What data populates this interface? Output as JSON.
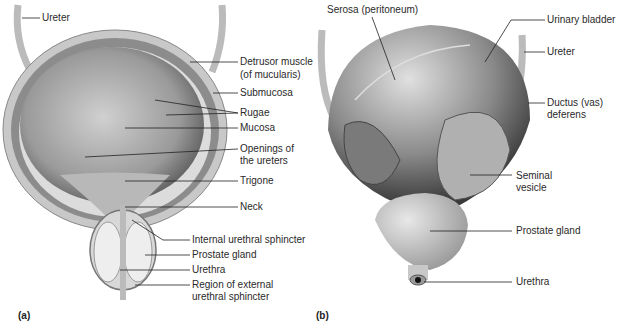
{
  "figure": {
    "panel_a": {
      "panel_label": "(a)",
      "labels": {
        "ureter": "Ureter",
        "detrusor_1": "Detrusor muscle",
        "detrusor_2": "(of mucularis)",
        "submucosa": "Submucosa",
        "rugae": "Rugae",
        "mucosa": "Mucosa",
        "openings_1": "Openings of",
        "openings_2": "the ureters",
        "trigone": "Trigone",
        "neck": "Neck",
        "internal_sphincter": "Internal urethral sphincter",
        "prostate": "Prostate gland",
        "urethra": "Urethra",
        "external_1": "Region of external",
        "external_2": "urethral sphincter"
      }
    },
    "panel_b": {
      "panel_label": "(b)",
      "labels": {
        "serosa": "Serosa (peritoneum)",
        "bladder": "Urinary bladder",
        "ureter": "Ureter",
        "ductus_1": "Ductus (vas)",
        "ductus_2": "deferens",
        "seminal_1": "Seminal",
        "seminal_2": "vesicle",
        "prostate": "Prostate gland",
        "urethra": "Urethra"
      }
    }
  }
}
